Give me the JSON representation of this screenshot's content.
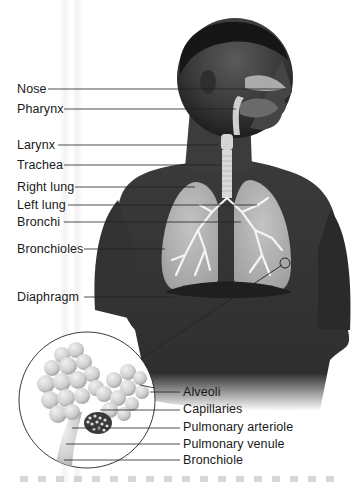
{
  "diagram": {
    "type": "anatomical-illustration",
    "labels": [
      {
        "id": "nose",
        "text": "Nose"
      },
      {
        "id": "pharynx",
        "text": "Pharynx"
      },
      {
        "id": "larynx",
        "text": "Larynx"
      },
      {
        "id": "trachea",
        "text": "Trachea"
      },
      {
        "id": "right-lung",
        "text": "Right lung"
      },
      {
        "id": "left-lung",
        "text": "Left lung"
      },
      {
        "id": "bronchi",
        "text": "Bronchi"
      },
      {
        "id": "bronchioles",
        "text": "Bronchioles"
      },
      {
        "id": "diaphragm",
        "text": "Diaphragm"
      }
    ],
    "inset": {
      "title": "Alveolus detail (magnified)",
      "labels": [
        {
          "id": "alveoli",
          "text": "Alveoli"
        },
        {
          "id": "capillaries",
          "text": "Capillaries"
        },
        {
          "id": "pulmonary-arteriole",
          "text": "Pulmonary arteriole"
        },
        {
          "id": "pulmonary-venule",
          "text": "Pulmonary venule"
        },
        {
          "id": "bronchiole",
          "text": "Bronchiole"
        }
      ]
    },
    "colors": {
      "background": "#ffffff",
      "skin_dark": "#2b2b2b",
      "skin_mid": "#4a4a4a",
      "lung": "#bdbdbd",
      "airway": "#d8d8d8",
      "leader_line": "#222222",
      "text": "#1a1a1a"
    }
  }
}
